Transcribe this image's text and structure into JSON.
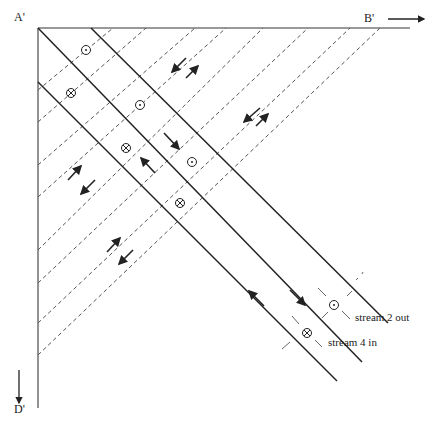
{
  "labels": {
    "corner_a": "A'",
    "corner_b": "B'",
    "corner_d": "D'",
    "stream2": "stream 2 out",
    "stream4": "stream 4 in"
  },
  "colors": {
    "axis": "#777777",
    "solid_line": "#222222",
    "dashed_line": "#555555",
    "arrow": "#222222"
  },
  "axes": {
    "origin": [
      38,
      28
    ],
    "top_end_x": 410,
    "left_end_y": 408
  },
  "solid_lines": [
    {
      "from": [
        38,
        28
      ],
      "to": [
        362,
        362
      ]
    },
    {
      "from": [
        91,
        28
      ],
      "to": [
        388,
        323
      ]
    },
    {
      "from": [
        38,
        82
      ],
      "to": [
        337,
        381
      ]
    }
  ],
  "dashed_lines": [
    {
      "from": [
        38,
        90
      ],
      "to": [
        113,
        28
      ]
    },
    {
      "from": [
        38,
        122
      ],
      "to": [
        146,
        28
      ]
    },
    {
      "from": [
        38,
        165
      ],
      "to": [
        195,
        28
      ]
    },
    {
      "from": [
        38,
        197
      ],
      "to": [
        226,
        28
      ]
    },
    {
      "from": [
        38,
        250
      ],
      "to": [
        263,
        28
      ]
    },
    {
      "from": [
        38,
        283
      ],
      "to": [
        308,
        28
      ]
    },
    {
      "from": [
        38,
        323
      ],
      "to": [
        350,
        28
      ]
    },
    {
      "from": [
        38,
        355
      ],
      "to": [
        380,
        28
      ]
    }
  ],
  "symbols": [
    {
      "type": "dot",
      "x": 86,
      "y": 50
    },
    {
      "type": "cross",
      "x": 71,
      "y": 93
    },
    {
      "type": "dot",
      "x": 140,
      "y": 105
    },
    {
      "type": "cross",
      "x": 126,
      "y": 148
    },
    {
      "type": "dot",
      "x": 192,
      "y": 162
    },
    {
      "type": "cross",
      "x": 180,
      "y": 203
    },
    {
      "type": "dot",
      "x": 334,
      "y": 305
    },
    {
      "type": "cross",
      "x": 307,
      "y": 333
    }
  ],
  "arrows": [
    {
      "from": [
        186,
        58
      ],
      "to": [
        172,
        72
      ]
    },
    {
      "from": [
        186,
        78
      ],
      "to": [
        198,
        66
      ]
    },
    {
      "from": [
        260,
        108
      ],
      "to": [
        244,
        122
      ]
    },
    {
      "from": [
        256,
        126
      ],
      "to": [
        268,
        114
      ]
    },
    {
      "from": [
        164,
        133
      ],
      "to": [
        179,
        149
      ]
    },
    {
      "from": [
        155,
        173
      ],
      "to": [
        141,
        158
      ]
    },
    {
      "from": [
        68,
        180
      ],
      "to": [
        81,
        166
      ]
    },
    {
      "from": [
        95,
        180
      ],
      "to": [
        81,
        194
      ]
    },
    {
      "from": [
        107,
        252
      ],
      "to": [
        120,
        238
      ]
    },
    {
      "from": [
        133,
        250
      ],
      "to": [
        119,
        264
      ]
    },
    {
      "from": [
        290,
        290
      ],
      "to": [
        305,
        305
      ]
    },
    {
      "from": [
        264,
        306
      ],
      "to": [
        249,
        291
      ]
    }
  ],
  "ticks": [
    {
      "from": [
        318,
        288
      ],
      "to": [
        326,
        296
      ]
    },
    {
      "from": [
        342,
        311
      ],
      "to": [
        350,
        319
      ]
    },
    {
      "from": [
        322,
        318
      ],
      "to": [
        328,
        312
      ]
    },
    {
      "from": [
        347,
        296
      ],
      "to": [
        352,
        291
      ]
    },
    {
      "from": [
        292,
        316
      ],
      "to": [
        299,
        324
      ]
    },
    {
      "from": [
        315,
        340
      ],
      "to": [
        322,
        347
      ]
    },
    {
      "from": [
        282,
        349
      ],
      "to": [
        290,
        342
      ]
    },
    {
      "from": [
        356,
        280
      ],
      "to": [
        358,
        278
      ]
    },
    {
      "from": [
        362,
        274
      ],
      "to": [
        363,
        272
      ]
    }
  ]
}
